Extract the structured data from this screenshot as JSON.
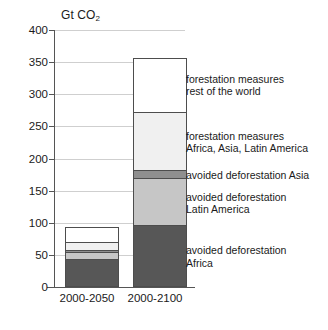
{
  "chart_data": {
    "type": "bar",
    "stacked": true,
    "title": "",
    "axis_title": "Gt CO",
    "axis_title_sub": "2",
    "xlabel": "",
    "ylabel": "Gt CO2",
    "ylim": [
      0,
      400
    ],
    "ytick_values": [
      0,
      50,
      100,
      150,
      200,
      250,
      300,
      350,
      400
    ],
    "ytick_labels": [
      "0",
      "50",
      "100",
      "150",
      "200",
      "250",
      "300",
      "350",
      "400"
    ],
    "grid": true,
    "legend_position": "inline-right-annotations",
    "categories": [
      "2000-2050",
      "2000-2100"
    ],
    "series": [
      {
        "name": "avoided deforestation Africa",
        "label_line1": "avoided deforestation",
        "label_line2": "Africa",
        "color": "#575757",
        "values": [
          42,
          95
        ]
      },
      {
        "name": "avoided deforestation Latin America",
        "label_line1": "avoided deforestation",
        "label_line2": "Latin America",
        "color": "#c6c6c6",
        "values": [
          12,
          73
        ]
      },
      {
        "name": "avoided deforestation Asia",
        "label_line1": "avoided deforestation Asia",
        "label_line2": "",
        "color": "#8f8f8f",
        "values": [
          3,
          12
        ]
      },
      {
        "name": "forestation measures Africa, Asia, Latin America",
        "label_line1": "forestation measures",
        "label_line2": "Africa, Asia, Latin America",
        "color": "#f0f0f0",
        "values": [
          12,
          92
        ]
      },
      {
        "name": "forestation measures rest of the world",
        "label_line1": "forestation measures",
        "label_line2": "rest of the world",
        "color": "#ffffff",
        "values": [
          24,
          85
        ]
      }
    ],
    "totals": [
      93,
      357
    ]
  },
  "annotations": [
    {
      "line1": "forestation measures",
      "line2": "rest of the world"
    },
    {
      "line1": "forestation measures",
      "line2": "Africa, Asia, Latin America"
    },
    {
      "line1": "avoided deforestation Asia",
      "line2": ""
    },
    {
      "line1": "avoided deforestation",
      "line2": "Latin America"
    },
    {
      "line1": "avoided deforestation",
      "line2": "Africa"
    }
  ]
}
